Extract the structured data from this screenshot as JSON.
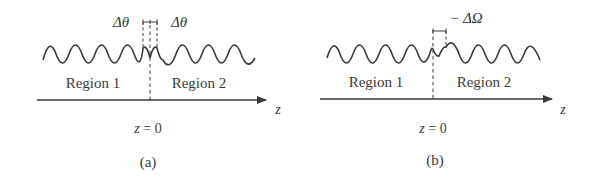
{
  "figure": {
    "panels": [
      {
        "id": "a",
        "caption": "(a)",
        "region_left": "Region 1",
        "region_right": "Region 2",
        "axis_label": "z",
        "origin_label": "z = 0",
        "shift_label_left": "Δθ",
        "shift_label_right": "Δθ"
      },
      {
        "id": "b",
        "caption": "(b)",
        "region_left": "Region 1",
        "region_right": "Region 2",
        "axis_label": "z",
        "origin_label": "z = 0",
        "shift_label": "− ΔΩ"
      }
    ],
    "colors": {
      "line": "#3a3a3a",
      "text": "#3a3a3a",
      "background": "#ffffff"
    }
  }
}
